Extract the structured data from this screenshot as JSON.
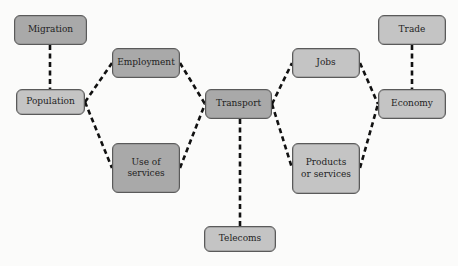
{
  "diagram": {
    "type": "concept-network",
    "nodes": [
      {
        "id": "migration",
        "label": "Migration",
        "shade": "dark",
        "x": 14,
        "y": 15,
        "w": 73,
        "h": 30
      },
      {
        "id": "population",
        "label": "Population",
        "shade": "light",
        "x": 16,
        "y": 89,
        "w": 69,
        "h": 26
      },
      {
        "id": "employment",
        "label": "Employment",
        "shade": "dark",
        "x": 112,
        "y": 48,
        "w": 68,
        "h": 30
      },
      {
        "id": "use-of-services",
        "label": "Use of services",
        "shade": "dark",
        "x": 112,
        "y": 143,
        "w": 68,
        "h": 50
      },
      {
        "id": "transport",
        "label": "Transport",
        "shade": "dark",
        "x": 205,
        "y": 89,
        "w": 67,
        "h": 30
      },
      {
        "id": "telecoms",
        "label": "Telecoms",
        "shade": "light",
        "x": 204,
        "y": 226,
        "w": 72,
        "h": 26
      },
      {
        "id": "jobs",
        "label": "Jobs",
        "shade": "light",
        "x": 292,
        "y": 48,
        "w": 68,
        "h": 30
      },
      {
        "id": "products-or-services",
        "label": "Products or services",
        "shade": "light",
        "x": 292,
        "y": 143,
        "w": 68,
        "h": 51
      },
      {
        "id": "trade",
        "label": "Trade",
        "shade": "light",
        "x": 378,
        "y": 15,
        "w": 68,
        "h": 30
      },
      {
        "id": "economy",
        "label": "Economy",
        "shade": "light",
        "x": 378,
        "y": 89,
        "w": 68,
        "h": 30
      }
    ],
    "edges": [
      {
        "from": "migration",
        "to": "population",
        "x1": 50,
        "y1": 45,
        "x2": 50,
        "y2": 89
      },
      {
        "from": "population",
        "to": "employment",
        "x1": 85,
        "y1": 102,
        "x2": 112,
        "y2": 63
      },
      {
        "from": "population",
        "to": "use-of-services",
        "x1": 85,
        "y1": 102,
        "x2": 112,
        "y2": 168
      },
      {
        "from": "employment",
        "to": "transport",
        "x1": 180,
        "y1": 63,
        "x2": 205,
        "y2": 104
      },
      {
        "from": "use-of-services",
        "to": "transport",
        "x1": 180,
        "y1": 168,
        "x2": 205,
        "y2": 104
      },
      {
        "from": "transport",
        "to": "telecoms",
        "x1": 240,
        "y1": 119,
        "x2": 240,
        "y2": 226
      },
      {
        "from": "transport",
        "to": "jobs",
        "x1": 272,
        "y1": 104,
        "x2": 292,
        "y2": 63
      },
      {
        "from": "transport",
        "to": "products-or-services",
        "x1": 272,
        "y1": 104,
        "x2": 292,
        "y2": 168
      },
      {
        "from": "jobs",
        "to": "economy",
        "x1": 360,
        "y1": 63,
        "x2": 378,
        "y2": 104
      },
      {
        "from": "products-or-services",
        "to": "economy",
        "x1": 360,
        "y1": 168,
        "x2": 378,
        "y2": 104
      },
      {
        "from": "trade",
        "to": "economy",
        "x1": 412,
        "y1": 45,
        "x2": 412,
        "y2": 89
      }
    ],
    "colors": {
      "dark_node": "#a9a9a9",
      "light_node": "#c4c4c4",
      "border": "#5a5a5a",
      "edge": "#111111",
      "background": "#fbfbfa"
    }
  }
}
